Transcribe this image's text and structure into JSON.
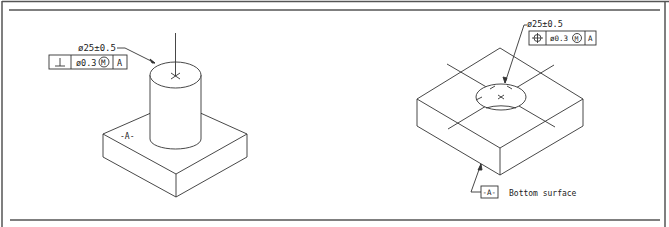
{
  "figure": {
    "left_view": {
      "dimension": "ø25±0.5",
      "fcf": {
        "symbol": "perpendicularity",
        "symbol_glyph": "⊥",
        "tolerance": "ø0.3",
        "modifier": "M",
        "datum": "A"
      },
      "datum_label": "-A-"
    },
    "right_view": {
      "dimension": "ø25±0.5",
      "fcf": {
        "symbol": "position",
        "symbol_glyph": "⌖",
        "tolerance": "ø0.3",
        "modifier": "M",
        "datum": "A"
      },
      "datum_label": "-A-",
      "datum_note": "Bottom surface"
    }
  },
  "colors": {
    "line": "#333333",
    "border": "#444444",
    "background": "#ffffff"
  }
}
